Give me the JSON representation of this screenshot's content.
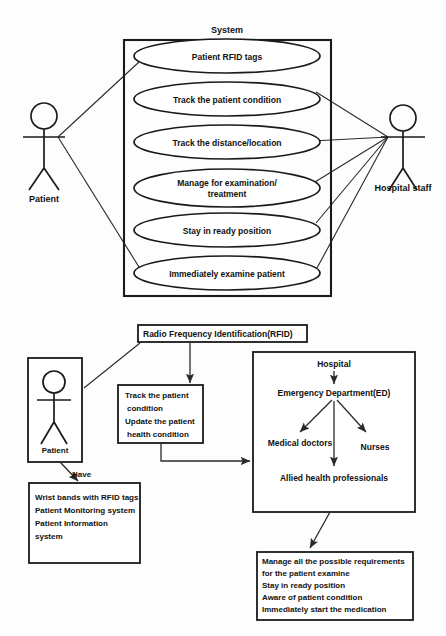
{
  "usecase_diagram": {
    "system_boundary_label": "System",
    "actors": [
      {
        "name": "Patient",
        "label": "Patient"
      },
      {
        "name": "Hospital staff",
        "label": "Hospital staff"
      }
    ],
    "use_cases": [
      {
        "label": "Patient RFID tags"
      },
      {
        "label": "Track the patient condition"
      },
      {
        "label": "Track the distance/location"
      },
      {
        "label": "Manage for examination/",
        "label2": "treatment"
      },
      {
        "label": "Stay in ready position"
      },
      {
        "label": "Immediately examine patient"
      }
    ]
  },
  "flow_diagram": {
    "rfid_box": {
      "label": "Radio Frequency Identification(RFID)"
    },
    "patient_actor_box": {
      "label": "Patient"
    },
    "have_label": "Have",
    "patient_assets_box": {
      "lines": [
        "Wrist bands with RFID tags",
        "Patient Monitoring system",
        "Patient Information",
        "system"
      ]
    },
    "track_box": {
      "lines": [
        "Track the patient",
        "condition",
        "Update the patient",
        "health condition"
      ]
    },
    "hospital_box": {
      "root": "Hospital",
      "department": "Emergency Department(ED)",
      "staff": [
        "Medical doctors",
        "Nurses",
        "Allied health professionals"
      ]
    },
    "requirements_box": {
      "lines": [
        "Manage all the possible requirements",
        "for the patient examine",
        "Stay in ready position",
        "Aware of patient condition",
        "Immediately start the medication"
      ]
    }
  },
  "colors": {
    "stroke": "#1a1a1a",
    "text": "#111111",
    "background": "#fdfdfd"
  }
}
